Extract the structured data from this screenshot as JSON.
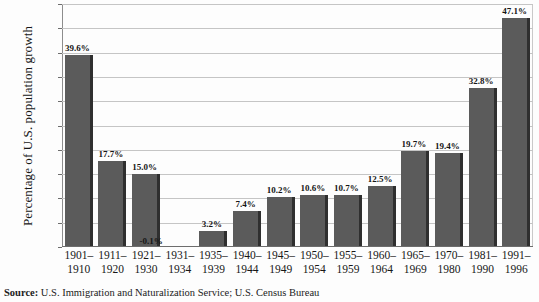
{
  "chart_data": {
    "type": "bar",
    "title": "",
    "xlabel": "",
    "ylabel": "Percentage of U.S. population growth",
    "ylim": [
      0,
      50
    ],
    "ytick_labels": [
      "50%",
      "",
      "40%",
      "35%",
      "30%",
      "25%",
      "20%",
      "15%",
      "10%",
      "5%",
      "0"
    ],
    "yticks": [
      50,
      45,
      40,
      35,
      30,
      25,
      20,
      15,
      10,
      5,
      0
    ],
    "grid": true,
    "legend": null,
    "bar_color": "#5b5b5b",
    "bar_edge_color": "#2f2f2f",
    "categories": [
      "1901-1910",
      "1911-1920",
      "1921-1930",
      "1931-1934",
      "1935-1939",
      "1940-1944",
      "1945-1949",
      "1950-1954",
      "1955-1959",
      "1960-1964",
      "1965-1969",
      "1970-1980",
      "1981-1990",
      "1991-1996"
    ],
    "values": [
      39.6,
      17.7,
      15.0,
      -0.1,
      3.2,
      7.4,
      10.2,
      10.6,
      10.7,
      12.5,
      19.7,
      19.4,
      32.8,
      47.1
    ],
    "data_labels": [
      "39.6%",
      "17.7%",
      "15.0%",
      "-0.1%",
      "3.2%",
      "7.4%",
      "10.2%",
      "10.6%",
      "10.7%",
      "12.5%",
      "19.7%",
      "19.4%",
      "32.8%",
      "47.1%"
    ]
  },
  "axis": {
    "y_title": "Percentage of U.S. population growth",
    "y_ticks": [
      {
        "label": "50%",
        "value": 50
      },
      {
        "label": "",
        "value": 45
      },
      {
        "label": "40%",
        "value": 40
      },
      {
        "label": "35%",
        "value": 35
      },
      {
        "label": "30%",
        "value": 30
      },
      {
        "label": "25%",
        "value": 25
      },
      {
        "label": "20%",
        "value": 20
      },
      {
        "label": "15%",
        "value": 15
      },
      {
        "label": "10%",
        "value": 10
      },
      {
        "label": "5%",
        "value": 5
      },
      {
        "label": "0",
        "value": 0
      }
    ],
    "x_ticks": [
      {
        "line1": "1901–",
        "line2": "1910"
      },
      {
        "line1": "1911–",
        "line2": "1920"
      },
      {
        "line1": "1921–",
        "line2": "1930"
      },
      {
        "line1": "1931–",
        "line2": "1934"
      },
      {
        "line1": "1935–",
        "line2": "1939"
      },
      {
        "line1": "1940–",
        "line2": "1944"
      },
      {
        "line1": "1945–",
        "line2": "1949"
      },
      {
        "line1": "1950–",
        "line2": "1954"
      },
      {
        "line1": "1955–",
        "line2": "1959"
      },
      {
        "line1": "1960–",
        "line2": "1964"
      },
      {
        "line1": "1965–",
        "line2": "1969"
      },
      {
        "line1": "1970–",
        "line2": "1980"
      },
      {
        "line1": "1981–",
        "line2": "1990"
      },
      {
        "line1": "1991–",
        "line2": "1996"
      }
    ]
  },
  "source": {
    "label": "Source:",
    "text": " U.S. Immigration and Naturalization Service; U.S. Census Bureau"
  }
}
